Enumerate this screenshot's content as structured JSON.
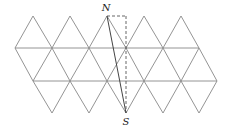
{
  "diagram": {
    "type": "triangular-net",
    "stroke_color": "#888888",
    "segment_color": "#555555",
    "labels": {
      "north": "N",
      "south": "S"
    },
    "geometry": {
      "top_vertices_x": [
        33,
        70,
        107,
        144,
        181
      ],
      "top_y": 16,
      "row1_y": 48,
      "row1_x": [
        15,
        52,
        89,
        126,
        163,
        199
      ],
      "row2_y": 81,
      "row2_x": [
        33,
        70,
        107,
        144,
        181,
        217
      ],
      "bottom_vertices_x": [
        52,
        89,
        126,
        163,
        199
      ],
      "bottom_y": 113,
      "N": [
        107,
        16
      ],
      "S": [
        126,
        113
      ],
      "corner": [
        126,
        16
      ]
    }
  }
}
